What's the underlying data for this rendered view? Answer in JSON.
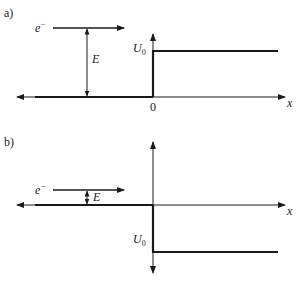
{
  "figure": {
    "colors": {
      "line": "#1a1a1a",
      "thin_line": "#555555",
      "background": "#ffffff"
    }
  },
  "panel_a": {
    "label": "a)",
    "electron_label": "e",
    "electron_charge": "−",
    "energy_label": "E",
    "potential_label": "U",
    "potential_subscript": "0",
    "origin_label": "0",
    "axis_label": "x",
    "step": "positive step (potential rises to U0 at x=0)"
  },
  "panel_b": {
    "label": "b)",
    "electron_label": "e",
    "electron_charge": "−",
    "energy_label": "E",
    "potential_label": "U",
    "potential_subscript": "0",
    "axis_label": "x",
    "step": "negative step (potential drops by U0 at x=0)"
  }
}
